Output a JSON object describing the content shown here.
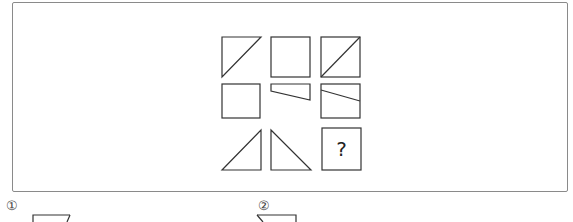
{
  "puzzle": {
    "question_mark": "?",
    "grid": [
      [
        "right-triangle-top-left",
        "square",
        "square-with-diagonal"
      ],
      [
        "square",
        "trapezoid-slanted-bottom",
        "square-with-slanted-line"
      ],
      [
        "right-triangle-bottom-right",
        "right-triangle-bottom-left",
        "unknown"
      ]
    ]
  },
  "choices": [
    {
      "label": "①"
    },
    {
      "label": "②"
    }
  ],
  "colors": {
    "stroke": "#333333",
    "frame": "#8a8a8a",
    "background": "#ffffff"
  }
}
